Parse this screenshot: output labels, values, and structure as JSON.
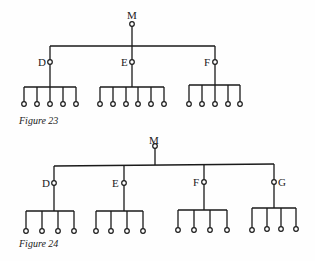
{
  "figures": [
    {
      "caption": "Figure 23",
      "root": {
        "label": "M"
      },
      "branches": [
        {
          "label": "D",
          "leaf_count": 5
        },
        {
          "label": "E",
          "leaf_count": 6
        },
        {
          "label": "F",
          "leaf_count": 5
        }
      ]
    },
    {
      "caption": "Figure 24",
      "root": {
        "label": "M"
      },
      "branches": [
        {
          "label": "D",
          "leaf_count": 4
        },
        {
          "label": "E",
          "leaf_count": 4
        },
        {
          "label": "F",
          "leaf_count": 4
        },
        {
          "label": "G",
          "leaf_count": 4
        }
      ]
    }
  ],
  "colors": {
    "ink": "#1a1a1a",
    "paper": "#fefefe"
  }
}
